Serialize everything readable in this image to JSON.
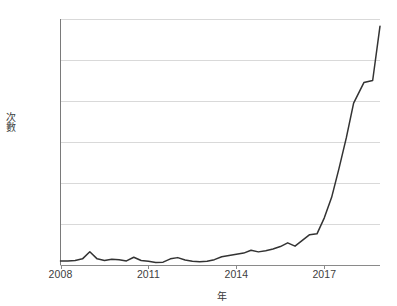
{
  "chart_data": {
    "type": "line",
    "title": "",
    "subtitle": "",
    "xlabel": "年",
    "ylabel": "次數",
    "xlim": [
      2008,
      2018.9
    ],
    "ylim": [
      0,
      1200
    ],
    "grid": true,
    "legend_position": "none",
    "y_ticks": [
      0,
      200,
      400,
      600,
      800,
      1000,
      1200
    ],
    "y_tick_labels": [
      "0",
      "200",
      "400",
      "600",
      "800",
      "1,000",
      "1,200"
    ],
    "x_ticks": [
      2008,
      2011,
      2014,
      2017
    ],
    "x_tick_labels": [
      "2008",
      "2011",
      "2014",
      "2017"
    ],
    "line_color": "#333333",
    "grid_color": "#d9d9d9",
    "series": [
      {
        "name": "次數",
        "x": [
          2008.0,
          2008.25,
          2008.5,
          2008.75,
          2009.0,
          2009.25,
          2009.5,
          2009.75,
          2010.0,
          2010.25,
          2010.5,
          2010.75,
          2011.0,
          2011.25,
          2011.5,
          2011.75,
          2012.0,
          2012.25,
          2012.5,
          2012.75,
          2013.0,
          2013.25,
          2013.5,
          2013.75,
          2014.0,
          2014.25,
          2014.5,
          2014.75,
          2015.0,
          2015.25,
          2015.5,
          2015.75,
          2016.0,
          2016.25,
          2016.5,
          2016.75,
          2017.0,
          2017.25,
          2017.5,
          2017.75,
          2018.0,
          2018.35,
          2018.65,
          2018.9
        ],
        "values": [
          20,
          20,
          22,
          30,
          65,
          30,
          22,
          28,
          26,
          20,
          38,
          22,
          18,
          12,
          14,
          30,
          36,
          24,
          18,
          16,
          18,
          26,
          40,
          46,
          52,
          58,
          72,
          64,
          70,
          78,
          90,
          108,
          92,
          120,
          148,
          152,
          230,
          330,
          470,
          620,
          790,
          890,
          900,
          1165
        ]
      }
    ]
  }
}
